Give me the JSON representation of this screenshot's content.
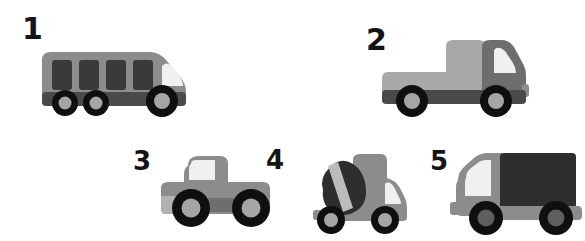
{
  "scene": {
    "title": "Numbered grey toy vehicles illustration",
    "background_color": "#ffffff",
    "width": 585,
    "height": 241
  },
  "palette": {
    "body_mid_grey": "#8c8c8c",
    "body_light_grey": "#a8a8a8",
    "body_dark_grey": "#6e6e6e",
    "window_dark": "#3a3a3a",
    "windshield_light": "#f0f0f0",
    "chassis_dark": "#4a4a4a",
    "tire_black": "#0f0f0f",
    "hub_grey": "#a5a5a5",
    "number_black": "#141414"
  },
  "vehicles": [
    {
      "number": "1",
      "name": "bus",
      "label": "bus",
      "number_x": 22,
      "number_y": 14,
      "number_size": 30,
      "x": 38,
      "y": 46,
      "width": 158,
      "height": 74,
      "wheel_count": 3,
      "window_count": 4,
      "facing": "right"
    },
    {
      "number": "2",
      "name": "dump-truck",
      "label": "dump truck",
      "number_x": 366,
      "number_y": 25,
      "number_size": 30,
      "x": 378,
      "y": 36,
      "width": 152,
      "height": 86,
      "wheel_count": 2,
      "window_count": 1,
      "facing": "right"
    },
    {
      "number": "3",
      "name": "pickup-car",
      "label": "pickup car",
      "number_x": 133,
      "number_y": 148,
      "number_size": 26,
      "x": 158,
      "y": 152,
      "width": 118,
      "height": 82,
      "wheel_count": 2,
      "window_count": 1,
      "facing": "right"
    },
    {
      "number": "4",
      "name": "cement-mixer-truck",
      "label": "cement mixer truck",
      "number_x": 266,
      "number_y": 147,
      "number_size": 26,
      "x": 303,
      "y": 152,
      "width": 112,
      "height": 86,
      "wheel_count": 2,
      "window_count": 1,
      "facing": "right"
    },
    {
      "number": "5",
      "name": "box-truck",
      "label": "box truck",
      "number_x": 430,
      "number_y": 148,
      "number_size": 26,
      "x": 450,
      "y": 150,
      "width": 132,
      "height": 88,
      "wheel_count": 2,
      "window_count": 1,
      "facing": "left"
    }
  ]
}
